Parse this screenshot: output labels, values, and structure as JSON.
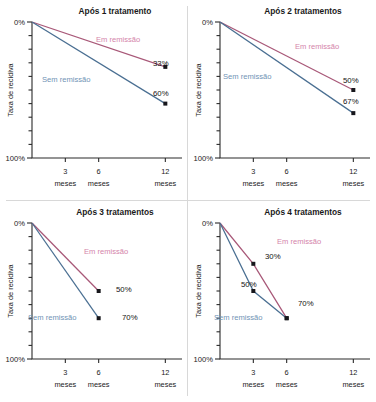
{
  "figure": {
    "axis_label_y": "Taxa de recidiva",
    "y_tick_top": "0%",
    "y_tick_bottom": "100%",
    "unit_label": "meses",
    "series_label_remission": "Em remissão",
    "series_label_noremission": "Sem remissão",
    "color_remission_line": "#a85878",
    "color_noremission_line": "#4a6f92",
    "color_remission_text": "#d484aa",
    "color_noremission_text": "#6f93b5",
    "color_marker": "#17171c",
    "color_axis": "#2b2b2b",
    "color_divider": "#d8d8d8",
    "background": "#ffffff"
  },
  "chart_data": [
    {
      "type": "line",
      "panel_index": 1,
      "title": "Após 1 tratamento",
      "xlabel": "meses",
      "ylabel": "Taxa de recidiva",
      "x_ticks": [
        "3",
        "6",
        "12"
      ],
      "x_tick_values": [
        3,
        6,
        12
      ],
      "ylim": [
        0,
        100
      ],
      "y_ticks": [
        "0%",
        "100%"
      ],
      "y_minor_step": 10,
      "grid": false,
      "legend": "inline-annotation",
      "series": [
        {
          "name": "Em remissão",
          "color": "#a85878",
          "x": [
            0,
            12
          ],
          "values": [
            0,
            33
          ],
          "point_labels": [
            null,
            "33%"
          ]
        },
        {
          "name": "Sem remissão",
          "color": "#4a6f92",
          "x": [
            0,
            12
          ],
          "values": [
            0,
            60
          ],
          "point_labels": [
            null,
            "60%"
          ]
        }
      ]
    },
    {
      "type": "line",
      "panel_index": 2,
      "title": "Após 2 tratamentos",
      "xlabel": "meses",
      "ylabel": "Taxa de recidiva",
      "x_ticks": [
        "3",
        "6",
        "12"
      ],
      "x_tick_values": [
        3,
        6,
        12
      ],
      "ylim": [
        0,
        100
      ],
      "y_ticks": [
        "0%",
        "100%"
      ],
      "y_minor_step": 10,
      "grid": false,
      "legend": "inline-annotation",
      "series": [
        {
          "name": "Em remissão",
          "color": "#a85878",
          "x": [
            0,
            12
          ],
          "values": [
            0,
            50
          ],
          "point_labels": [
            null,
            "50%"
          ]
        },
        {
          "name": "Sem remissão",
          "color": "#4a6f92",
          "x": [
            0,
            12
          ],
          "values": [
            0,
            67
          ],
          "point_labels": [
            null,
            "67%"
          ]
        }
      ]
    },
    {
      "type": "line",
      "panel_index": 3,
      "title": "Após 3 tratamentos",
      "xlabel": "meses",
      "ylabel": "Taxa de recidiva",
      "x_ticks": [
        "3",
        "6",
        "12"
      ],
      "x_tick_values": [
        3,
        6,
        12
      ],
      "ylim": [
        0,
        100
      ],
      "y_ticks": [
        "0%",
        "100%"
      ],
      "y_minor_step": 10,
      "grid": false,
      "legend": "inline-annotation",
      "series": [
        {
          "name": "Em remissão",
          "color": "#a85878",
          "x": [
            0,
            6
          ],
          "values": [
            0,
            50
          ],
          "point_labels": [
            null,
            "50%"
          ]
        },
        {
          "name": "Sem remissão",
          "color": "#4a6f92",
          "x": [
            0,
            6
          ],
          "values": [
            0,
            70
          ],
          "point_labels": [
            null,
            "70%"
          ]
        }
      ]
    },
    {
      "type": "line",
      "panel_index": 4,
      "title": "Após 4 tratamentos",
      "xlabel": "meses",
      "ylabel": "Taxa de recidiva",
      "x_ticks": [
        "3",
        "6",
        "12"
      ],
      "x_tick_values": [
        3,
        6,
        12
      ],
      "ylim": [
        0,
        100
      ],
      "y_ticks": [
        "0%",
        "100%"
      ],
      "y_minor_step": 10,
      "grid": false,
      "legend": "inline-annotation",
      "series": [
        {
          "name": "Em remissão",
          "color": "#a85878",
          "x": [
            0,
            3,
            6
          ],
          "values": [
            0,
            30,
            70
          ],
          "point_labels": [
            null,
            "30%",
            "70%"
          ]
        },
        {
          "name": "Sem remissão",
          "color": "#4a6f92",
          "x": [
            0,
            3,
            6
          ],
          "values": [
            0,
            50,
            70
          ],
          "point_labels": [
            null,
            "50%",
            null
          ]
        }
      ]
    }
  ],
  "annotations": [
    {
      "panel_index": 1,
      "remission_label_x": 96,
      "remission_label_y": 42,
      "noremission_label_x": 42,
      "noremission_label_y": 82,
      "value_labels": [
        {
          "text": "33%",
          "x": 153,
          "y": 66,
          "align": "start"
        },
        {
          "text": "60%",
          "x": 153,
          "y": 96,
          "align": "start"
        }
      ]
    },
    {
      "panel_index": 2,
      "remission_label_x": 107,
      "remission_label_y": 49,
      "noremission_label_x": 35,
      "noremission_label_y": 79,
      "value_labels": [
        {
          "text": "50%",
          "x": 155,
          "y": 83,
          "align": "start"
        },
        {
          "text": "67%",
          "x": 155,
          "y": 104,
          "align": "start"
        }
      ]
    },
    {
      "panel_index": 3,
      "remission_label_x": 84,
      "remission_label_y": 53,
      "noremission_label_x": 28,
      "noremission_label_y": 119,
      "value_labels": [
        {
          "text": "50%",
          "x": 116,
          "y": 91,
          "align": "start"
        },
        {
          "text": "70%",
          "x": 122,
          "y": 119,
          "align": "start"
        }
      ]
    },
    {
      "panel_index": 4,
      "remission_label_x": 89,
      "remission_label_y": 43,
      "noremission_label_x": 26,
      "noremission_label_y": 119,
      "value_labels": [
        {
          "text": "30%",
          "x": 77,
          "y": 58,
          "align": "start"
        },
        {
          "text": "50%",
          "x": 53,
          "y": 86,
          "align": "start"
        },
        {
          "text": "70%",
          "x": 110,
          "y": 105,
          "align": "start"
        }
      ]
    }
  ]
}
